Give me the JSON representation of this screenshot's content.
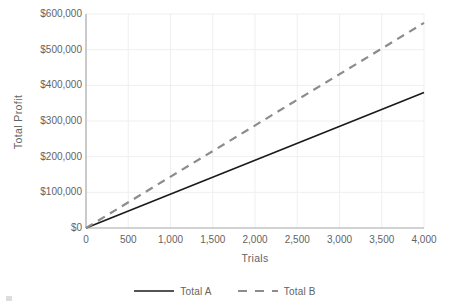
{
  "chart_data": {
    "type": "line",
    "title": "",
    "xlabel": "Trials",
    "ylabel": "Total Profit",
    "xlim": [
      0,
      4000
    ],
    "ylim": [
      0,
      600000
    ],
    "grid": true,
    "legend_position": "bottom",
    "x_tick_labels": [
      "0",
      "500",
      "1,000",
      "1,500",
      "2,000",
      "2,500",
      "3,000",
      "3,500",
      "4,000"
    ],
    "x_ticks": [
      0,
      500,
      1000,
      1500,
      2000,
      2500,
      3000,
      3500,
      4000
    ],
    "y_tick_labels": [
      "$0",
      "$100,000",
      "$200,000",
      "$300,000",
      "$400,000",
      "$500,000",
      "$600,000"
    ],
    "y_ticks": [
      0,
      100000,
      200000,
      300000,
      400000,
      500000,
      600000
    ],
    "x": [
      0,
      4000
    ],
    "series": [
      {
        "name": "Total A",
        "values": [
          0,
          380000
        ],
        "color": "#1a1a1a",
        "style": "solid",
        "width": 1.6
      },
      {
        "name": "Total B",
        "values": [
          0,
          575000
        ],
        "color": "#8c8c8c",
        "style": "dashed",
        "width": 2.2
      }
    ],
    "colors": {
      "axis": "#a6a6a6",
      "grid": "#efefef",
      "text": "#636363",
      "background": "#ffffff",
      "series_a": "#1a1a1a",
      "series_b": "#8c8c8c"
    }
  },
  "legend": {
    "items": [
      {
        "label": "Total A"
      },
      {
        "label": "Total B"
      }
    ]
  }
}
